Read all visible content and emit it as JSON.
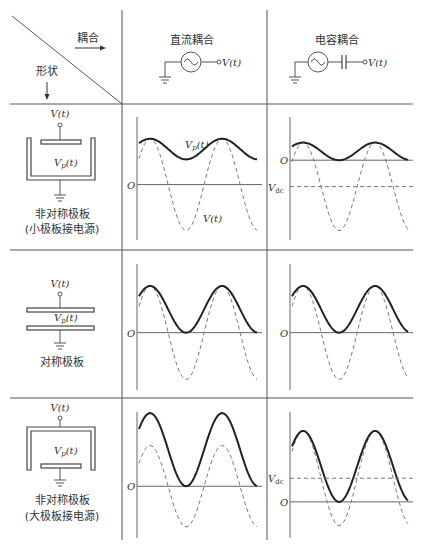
{
  "header": {
    "coupling_label": "耦合",
    "shape_label": "形状",
    "columns": [
      {
        "id": "dc",
        "title": "直流耦合",
        "source_output": "V(t)",
        "has_capacitor": false
      },
      {
        "id": "cap",
        "title": "电容耦合",
        "source_output": "V(t)",
        "has_capacitor": true
      }
    ]
  },
  "rows": [
    {
      "id": "asym-small",
      "shape_title": "非对称极板",
      "shape_subtitle": "(小极板接电源)",
      "input_label": "V(t)",
      "plasma_label": "Vp(t)",
      "plasma_label_main": "V",
      "plasma_label_sub": "p",
      "plasma_label_tail": "(t)"
    },
    {
      "id": "sym",
      "shape_title": "对称极板",
      "shape_subtitle": "",
      "input_label": "V(t)",
      "plasma_label": "Vp(t)",
      "plasma_label_main": "V",
      "plasma_label_sub": "p",
      "plasma_label_tail": "(t)"
    },
    {
      "id": "asym-large",
      "shape_title": "非对称极板",
      "shape_subtitle": "(大极板接电源)",
      "input_label": "V(t)",
      "plasma_label": "Vp(t)",
      "plasma_label_main": "V",
      "plasma_label_sub": "p",
      "plasma_label_tail": "(t)"
    }
  ],
  "plot_labels": {
    "origin": "O",
    "vdc_main": "V",
    "vdc_sub": "dc",
    "vp_curve": "Vp(t)",
    "v_curve": "V(t)"
  },
  "chart_data": [
    {
      "type": "line",
      "panel": "asym-small / dc",
      "title": "",
      "origin_label": "O",
      "series": [
        {
          "name": "V(t)",
          "style": "dashed",
          "offset": 0,
          "amplitude": 1.0,
          "phase_deg": 60
        },
        {
          "name": "Vp(t)",
          "style": "solid",
          "min": 0.55,
          "max": 1.0,
          "annotated": true
        }
      ],
      "vdc": null,
      "ylim": [
        -1.1,
        1.3
      ]
    },
    {
      "type": "line",
      "panel": "asym-small / cap",
      "title": "",
      "origin_label": "O",
      "series": [
        {
          "name": "V(t)",
          "style": "dashed",
          "offset": -0.6,
          "amplitude": 1.0,
          "phase_deg": 60
        },
        {
          "name": "Vp(t)",
          "style": "solid",
          "min": 0.0,
          "max": 0.4
        }
      ],
      "vdc": -0.6,
      "vdc_label": "Vdc",
      "ylim": [
        -1.7,
        0.8
      ]
    },
    {
      "type": "line",
      "panel": "sym / dc",
      "title": "",
      "origin_label": "O",
      "series": [
        {
          "name": "V(t)",
          "style": "dashed",
          "offset": 0,
          "amplitude": 1.0,
          "phase_deg": 60
        },
        {
          "name": "Vp(t)",
          "style": "solid",
          "min": 0.0,
          "max": 1.0
        }
      ],
      "vdc": null,
      "ylim": [
        -1.1,
        1.3
      ]
    },
    {
      "type": "line",
      "panel": "sym / cap",
      "title": "",
      "origin_label": "O",
      "series": [
        {
          "name": "V(t)",
          "style": "dashed",
          "offset": 0,
          "amplitude": 1.0,
          "phase_deg": 60
        },
        {
          "name": "Vp(t)",
          "style": "solid",
          "min": 0.0,
          "max": 1.0
        }
      ],
      "vdc": 0,
      "ylim": [
        -1.1,
        1.3
      ]
    },
    {
      "type": "line",
      "panel": "asym-large / dc",
      "title": "",
      "origin_label": "O",
      "series": [
        {
          "name": "V(t)",
          "style": "dashed",
          "offset": 0,
          "amplitude": 1.0,
          "phase_deg": 60
        },
        {
          "name": "Vp(t)",
          "style": "solid",
          "min": 0.0,
          "max": 1.8
        }
      ],
      "vdc": null,
      "ylim": [
        -1.2,
        2.0
      ]
    },
    {
      "type": "line",
      "panel": "asym-large / cap",
      "title": "",
      "origin_label": "O",
      "series": [
        {
          "name": "V(t)",
          "style": "dashed",
          "offset": 0.5,
          "amplitude": 1.0,
          "phase_deg": 60
        },
        {
          "name": "Vp(t)",
          "style": "solid",
          "min": 0.0,
          "max": 1.5
        }
      ],
      "vdc": 0.5,
      "vdc_label": "Vdc",
      "ylim": [
        -0.7,
        1.9
      ]
    }
  ]
}
